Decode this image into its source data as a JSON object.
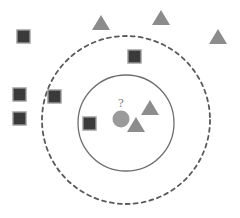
{
  "figure": {
    "width": 240,
    "height": 218,
    "background_color": "#ffffff"
  },
  "colors": {
    "square_fill": "#3a3a3a",
    "square_stroke": "#9a9a9a",
    "triangle_fill": "#8c8c8c",
    "query_fill": "#9a9a9a",
    "inner_circle_stroke": "#6e6e6e",
    "outer_circle_stroke": "#5a5a5a",
    "label_color": "#7d7d7d"
  },
  "query_point": {
    "label": "?",
    "cx": 121,
    "cy": 119,
    "r": 8.5,
    "label_x": 121,
    "label_y": 104
  },
  "neighborhoods": [
    {
      "name": "inner-neighborhood",
      "style": "solid",
      "cx": 126,
      "cy": 123,
      "r": 48,
      "stroke_width": 1.3
    },
    {
      "name": "outer-neighborhood",
      "style": "dashed",
      "cx": 126,
      "cy": 120,
      "r": 84,
      "stroke_width": 1.8,
      "dash_pattern": "4 4"
    }
  ],
  "class_squares": {
    "class_name": "class-square",
    "size": 13,
    "points": [
      {
        "id": "square-1",
        "x": 17,
        "y": 30
      },
      {
        "id": "square-2",
        "x": 128,
        "y": 50
      },
      {
        "id": "square-3",
        "x": 13,
        "y": 88
      },
      {
        "id": "square-4",
        "x": 48,
        "y": 90
      },
      {
        "id": "square-5",
        "x": 13,
        "y": 112
      },
      {
        "id": "square-6",
        "x": 83,
        "y": 117
      }
    ]
  },
  "class_triangles": {
    "class_name": "class-triangle",
    "width": 18,
    "height": 15,
    "points": [
      {
        "id": "triangle-1",
        "x": 92,
        "y": 15
      },
      {
        "id": "triangle-2",
        "x": 152,
        "y": 10
      },
      {
        "id": "triangle-3",
        "x": 209,
        "y": 29
      },
      {
        "id": "triangle-4",
        "x": 141,
        "y": 100
      },
      {
        "id": "triangle-5",
        "x": 127,
        "y": 117
      }
    ]
  }
}
